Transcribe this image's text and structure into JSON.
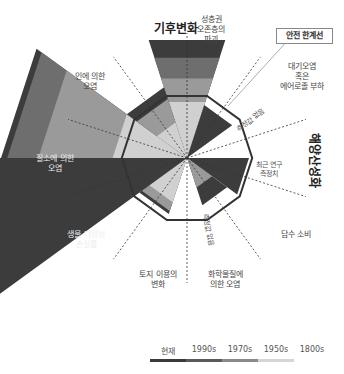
{
  "safe_boundary_label": "안전 한계선",
  "center_labels": {
    "no_measure_1": "측정값 없음",
    "no_measure_2": "측정값 없음",
    "recent_study": [
      "최근 연구",
      "측정치"
    ]
  },
  "legend": {
    "items": [
      {
        "label": "현재",
        "color": "#3a3a3a"
      },
      {
        "label": "1990s",
        "color": "#5a5a5a"
      },
      {
        "label": "1970s",
        "color": "#8a8a8a"
      },
      {
        "label": "1950s",
        "color": "#cfcfcf"
      },
      {
        "label": "1800s",
        "color": "#ffffff"
      }
    ]
  },
  "chart_data": {
    "type": "polar-area",
    "title": "",
    "boundary_ratio": 1.0,
    "layer_colors": {
      "1950s": "#d0d0d0",
      "1970s": "#9a9a9a",
      "1990s": "#6e6e6e",
      "현재": "#3c3c3c"
    },
    "processes": [
      {
        "name": "기후변화",
        "lines": [
          "기후변화"
        ],
        "status": "exceeded",
        "emphasis": true,
        "levels": {
          "1950s": 0.95,
          "1970s": 1.35,
          "1990s": 1.7,
          "현재": 2.0
        }
      },
      {
        "name": "성층권 오존층의 파괴",
        "lines": [
          "성층권",
          "오존층의",
          "파괴"
        ],
        "status": "safe",
        "levels": {
          "현재": 0.9
        }
      },
      {
        "name": "대기오염 혹은 에어로졸 부하",
        "lines": [
          "대기오염",
          "혹은",
          "에어로졸 부하"
        ],
        "status": "not_measured",
        "levels": {}
      },
      {
        "name": "해양산성화",
        "lines": [
          "해양산성화"
        ],
        "status": "safe",
        "emphasis": true,
        "levels": {
          "현재": 1.0
        }
      },
      {
        "name": "담수 소비",
        "lines": [
          "담수 소비"
        ],
        "status": "safe",
        "levels": {
          "1970s": 0.5,
          "현재": 0.8
        }
      },
      {
        "name": "화학물질에 의한 오염",
        "lines": [
          "화학물질에",
          "의한 오염"
        ],
        "status": "not_measured",
        "levels": {}
      },
      {
        "name": "토지 이용의 변화",
        "lines": [
          "토지 이용의",
          "변화"
        ],
        "status": "near",
        "levels": {
          "1950s": 0.75,
          "1970s": 0.9,
          "현재": 0.95
        }
      },
      {
        "name": "생물 다양성 손실률",
        "lines": [
          "생물 다양성",
          "손실률"
        ],
        "status": "exceeded",
        "levels": {
          "현재": 3.9
        }
      },
      {
        "name": "질소에 의한 오염",
        "lines": [
          "질소에 의한",
          "오염"
        ],
        "status": "exceeded",
        "levels": {
          "1950s": 1.2,
          "1970s": 2.4,
          "1990s": 2.9,
          "현재": 3.0
        }
      },
      {
        "name": "인에 의한 오염",
        "lines": [
          "인에 의한",
          "오염"
        ],
        "status": "exceeded",
        "levels": {
          "1950s": 0.6,
          "1970s": 1.0,
          "현재": 1.2
        }
      }
    ]
  }
}
